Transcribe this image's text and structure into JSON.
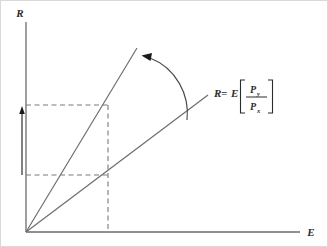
{
  "figure": {
    "background_color": "#ffffff",
    "border_color": "#d9d9d9",
    "line_color": "#6b6b6b",
    "dash_color": "#7a7a7a",
    "arrow_color": "#1a1a1a",
    "text_color": "#2b2b2b"
  },
  "axes": {
    "y_label": "R",
    "x_label": "E",
    "origin": {
      "x": 26,
      "y": 232
    },
    "y_top": {
      "x": 26,
      "y": 22
    },
    "x_right": {
      "x": 300,
      "y": 232
    }
  },
  "lines": {
    "steep_ray": {
      "name": "steep-ray",
      "from": {
        "x": 26,
        "y": 232
      },
      "to": {
        "x": 137,
        "y": 48
      }
    },
    "shallow_ray": {
      "name": "shallow-ray",
      "from": {
        "x": 26,
        "y": 232
      },
      "to": {
        "x": 208,
        "y": 95
      }
    }
  },
  "guides": {
    "upper_horizontal": {
      "from": {
        "x": 26,
        "y": 105
      },
      "to": {
        "x": 108,
        "y": 105
      }
    },
    "lower_horizontal": {
      "from": {
        "x": 26,
        "y": 175
      },
      "to": {
        "x": 108,
        "y": 175
      }
    },
    "vertical": {
      "from": {
        "x": 108,
        "y": 105
      },
      "to": {
        "x": 108,
        "y": 232
      }
    }
  },
  "span_arrow": {
    "label": "vertical-span",
    "x": 22,
    "top": {
      "y": 110
    },
    "bottom": {
      "y": 175
    }
  },
  "angle_arc": {
    "label": "rotation-arc",
    "start": {
      "x": 187,
      "y": 120
    },
    "end": {
      "x": 146,
      "y": 58
    },
    "points_to": "steep-ray"
  },
  "equation": {
    "lhs": "R",
    "equals": "=",
    "operator": "E",
    "bracket_open": "[",
    "bracket_close": "]",
    "numerator": "P",
    "numerator_sub": "y",
    "denominator": "P",
    "denominator_sub": "x",
    "plain": "R = E[Py/Px]"
  }
}
